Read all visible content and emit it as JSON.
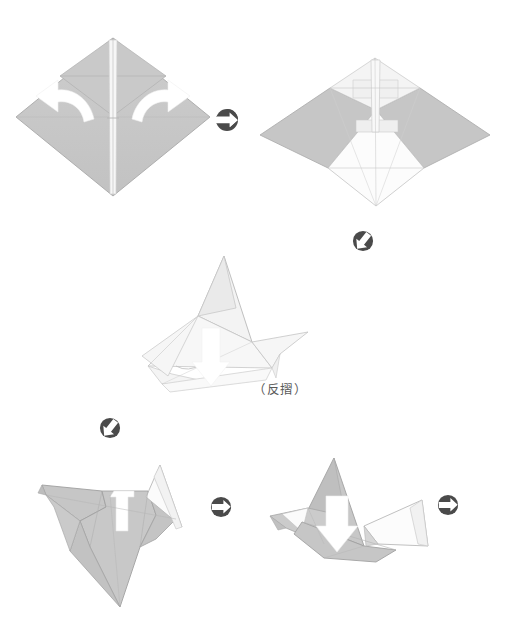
{
  "document": {
    "type": "origami-instruction-diagram",
    "title": "",
    "background_color": "#ffffff",
    "width": 512,
    "height": 643
  },
  "palette": {
    "paper_gray": "#c6c6c6",
    "paper_gray_dark": "#b4b4b4",
    "paper_gray_mid": "#d0d0d0",
    "paper_white": "#fbfbfb",
    "paper_offwhite": "#f2f2f2",
    "outline": "#9a9a9a",
    "outline_soft": "#c9c9c9",
    "arrow_white": "#ffffff",
    "connector_dark": "#4a4a4a",
    "caption_text": "#5a5a5a"
  },
  "steps": [
    {
      "id": "step-1",
      "name": "diamond-with-two-curved-arrows",
      "description": "Gray diamond (kite base) with two white curved arrows pointing outward",
      "arrows": [
        {
          "name": "curved-arrow-left",
          "direction": "left-up",
          "color": "#ffffff"
        },
        {
          "name": "curved-arrow-right",
          "direction": "right-up",
          "color": "#ffffff"
        }
      ]
    },
    {
      "id": "step-2",
      "name": "four-pointed-star-form",
      "description": "Four pointed star shape after opening the flaps",
      "arrows": []
    },
    {
      "id": "step-3",
      "name": "angled-form-reverse-fold",
      "description": "Angled three dimensional form with a white down arrow indicating a reverse fold",
      "arrows": [
        {
          "name": "down-arrow",
          "direction": "down",
          "color": "#ffffff"
        }
      ],
      "caption": "（反摺）"
    },
    {
      "id": "step-4",
      "name": "bird-form-flat",
      "description": "Flattened bird like form with a white notch at the top center",
      "arrows": []
    },
    {
      "id": "step-5",
      "name": "bird-form-with-down-arrow",
      "description": "Bird like form with raised head and a white down arrow",
      "arrows": [
        {
          "name": "down-arrow",
          "direction": "down",
          "color": "#ffffff"
        }
      ]
    }
  ],
  "connectors": [
    {
      "id": "connector-1",
      "name": "connector-arrow-right",
      "style": "circle-arrow",
      "direction": "right",
      "color": "#4a4a4a"
    },
    {
      "id": "connector-2",
      "name": "connector-arrow-down-left",
      "style": "circle-arrow",
      "direction": "down-left",
      "color": "#4a4a4a"
    },
    {
      "id": "connector-3",
      "name": "connector-arrow-down-left",
      "style": "circle-arrow",
      "direction": "down-left",
      "color": "#4a4a4a"
    },
    {
      "id": "connector-4",
      "name": "connector-arrow-right",
      "style": "circle-arrow",
      "direction": "right",
      "color": "#4a4a4a"
    },
    {
      "id": "connector-5",
      "name": "connector-arrow-right",
      "style": "circle-arrow",
      "direction": "right",
      "color": "#4a4a4a"
    }
  ],
  "captions": {
    "reverse_fold": "（反摺）"
  }
}
